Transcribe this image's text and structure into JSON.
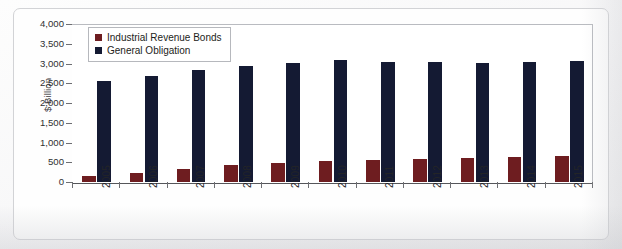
{
  "chart_data": {
    "type": "bar",
    "title": "",
    "xlabel": "",
    "ylabel": "$ Billion",
    "ylim": [
      0,
      4000
    ],
    "yticks": [
      "0",
      "500",
      "1,000",
      "1,500",
      "2,000",
      "2,500",
      "3,000",
      "3,500",
      "4,000"
    ],
    "ytick_values": [
      0,
      500,
      1000,
      1500,
      2000,
      2500,
      3000,
      3500,
      4000
    ],
    "grid": false,
    "legend_position": "upper-left-inside",
    "categories": [
      "2005",
      "2006",
      "2007",
      "2008",
      "2009",
      "2010",
      "2011",
      "2012",
      "2013",
      "2014",
      "2015"
    ],
    "series": [
      {
        "name": "Industrial Revenue Bonds",
        "color": "#6e1d20",
        "values": [
          150,
          220,
          330,
          420,
          480,
          530,
          560,
          580,
          620,
          640,
          660
        ]
      },
      {
        "name": "General Obligation",
        "color": "#141a33",
        "values": [
          2570,
          2680,
          2830,
          2930,
          3010,
          3080,
          3040,
          3050,
          3020,
          3030,
          3070
        ]
      }
    ]
  },
  "legend": {
    "items": [
      {
        "label": "Industrial Revenue Bonds",
        "color": "#6e1d20"
      },
      {
        "label": "General Obligation",
        "color": "#141a33"
      }
    ]
  },
  "axis": {
    "y_title": "$ Billion"
  }
}
